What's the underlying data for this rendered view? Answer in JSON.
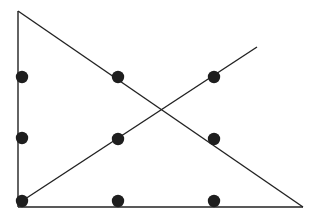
{
  "diagram": {
    "colors": {
      "line": "#222222",
      "dot": "#1e1e1e",
      "background": "#ffffff"
    },
    "dots": [
      {
        "x": 22,
        "y": 77
      },
      {
        "x": 118,
        "y": 77
      },
      {
        "x": 214,
        "y": 77
      },
      {
        "x": 22,
        "y": 138
      },
      {
        "x": 118,
        "y": 139
      },
      {
        "x": 214,
        "y": 139
      },
      {
        "x": 22,
        "y": 201
      },
      {
        "x": 118,
        "y": 201
      },
      {
        "x": 214,
        "y": 201
      }
    ],
    "lines": [
      {
        "name": "vertical-line",
        "x1": 18,
        "y1": 11,
        "x2": 18,
        "y2": 207
      },
      {
        "name": "diagonal-down-line",
        "x1": 18,
        "y1": 11,
        "x2": 303,
        "y2": 207
      },
      {
        "name": "bottom-line",
        "x1": 18,
        "y1": 207,
        "x2": 303,
        "y2": 207
      },
      {
        "name": "diagonal-up-line",
        "x1": 22,
        "y1": 201,
        "x2": 257,
        "y2": 47
      }
    ]
  }
}
